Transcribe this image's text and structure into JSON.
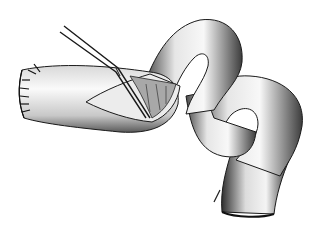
{
  "illustration": {
    "subject": "surgical illustration of intestinal loop with forceps",
    "style": "grayscale pencil drawing",
    "colors": {
      "background": "#ffffff",
      "tissue_light": "#f2f2f2",
      "tissue_mid": "#bdbdbd",
      "tissue_dark": "#3a3a3a",
      "outline": "#1a1a1a"
    },
    "elements": [
      {
        "name": "bowel-loop",
        "description": "coiled tubular intestine forming an S-curve to lower right"
      },
      {
        "name": "sutured-end",
        "description": "closed left stump with interrupted sutures"
      },
      {
        "name": "incision",
        "description": "slit opening in bowel wall exposing mucosal folds"
      },
      {
        "name": "forceps",
        "description": "surgical forceps inserted into incision from upper left"
      }
    ]
  }
}
